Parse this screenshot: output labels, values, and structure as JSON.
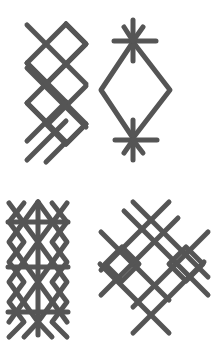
{
  "figure": {
    "background": "#ffffff",
    "stroke_color": "#555555",
    "stroke_width": 5,
    "symbols": [
      {
        "name": "zigzag-diamond-chain",
        "position": "top-left",
        "description": "Vertical chain of three interlocking diamonds with crossing lines"
      },
      {
        "name": "diamond-with-asterisks",
        "position": "top-right",
        "description": "Single large diamond with six-spoke asterisks at the top and bottom vertices"
      },
      {
        "name": "lattice-with-bars",
        "position": "bottom-left",
        "description": "Double diamond lattice with vertical axis and three horizontal bars"
      },
      {
        "name": "crossed-diamond-with-side-diamonds",
        "position": "bottom-right",
        "description": "Large diamond formed by crossing lines with small diamonds on the left and right"
      }
    ]
  }
}
